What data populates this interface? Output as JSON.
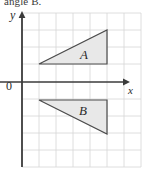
{
  "caption": {
    "fragment_text": "angle B."
  },
  "figure": {
    "name": "coordinate-grid-triangles",
    "width": 142,
    "height": 174,
    "background_color": "#ffffff"
  },
  "axes": {
    "y_label": "y",
    "x_label": "x",
    "origin_label": "0",
    "axis_color": "#3b3b3b",
    "x_axis_y_px": 82,
    "y_axis_x_px": 22,
    "x_arrow_tip_px": 129,
    "y_arrow_tip_px": 12
  },
  "grid": {
    "color": "#d6d6d6",
    "cell_size_px": 17,
    "vertical_lines_px": [
      22,
      39,
      56,
      73,
      90,
      107,
      124
    ],
    "horizontal_lines_px": [
      13,
      30,
      47,
      64,
      82,
      99,
      116,
      133,
      150,
      167
    ],
    "left_px": 22,
    "right_px": 141,
    "top_px": 13,
    "bottom_px": 167
  },
  "shapes": [
    {
      "label": "A",
      "name": "triangle-a",
      "fill_color": "#e8e8e8",
      "stroke_color": "#4a4a4a",
      "points_px": "39,64 107,30 107,64",
      "vertices_grid": [
        [
          1,
          1
        ],
        [
          5,
          3
        ],
        [
          5,
          1
        ]
      ]
    },
    {
      "label": "B",
      "name": "triangle-b",
      "fill_color": "#e8e8e8",
      "stroke_color": "#4a4a4a",
      "points_px": "39,100 107,100 107,134",
      "vertices_grid": [
        [
          1,
          -1
        ],
        [
          5,
          -1
        ],
        [
          5,
          -3
        ]
      ]
    }
  ]
}
